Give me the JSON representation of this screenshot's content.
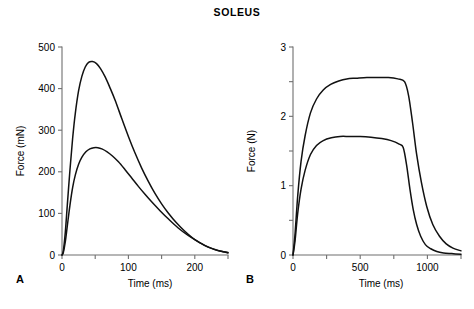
{
  "figure": {
    "title": "SOLEUS",
    "background": "#ffffff",
    "curve_color": "#111111",
    "axis_color": "#6f6f6f"
  },
  "panels": [
    {
      "label": "A",
      "xlabel": "Time (ms)",
      "ylabel": "Force (mN)"
    },
    {
      "label": "B",
      "xlabel": "Time (ms)",
      "ylabel": "Force (N)"
    }
  ],
  "chart_data": [
    {
      "type": "line",
      "panel": "A",
      "title": "SOLEUS",
      "xlabel": "Time (ms)",
      "ylabel": "Force (mN)",
      "xlim": [
        0,
        250
      ],
      "ylim": [
        0,
        500
      ],
      "xticks": [
        0,
        50,
        100,
        150,
        200,
        250
      ],
      "xticklabels": [
        "0",
        "",
        "100",
        "",
        "200",
        ""
      ],
      "yticks": [
        0,
        100,
        200,
        300,
        400,
        500
      ],
      "yticklabels": [
        "0",
        "100",
        "200",
        "300",
        "400",
        "500"
      ],
      "grid": false,
      "legend": "none",
      "annotation": "Isometric twitch responses; two superimposed traces",
      "series": [
        {
          "name": "upper-twitch",
          "peak_value": 465,
          "peak_time": 46,
          "x": [
            0,
            2,
            5,
            8,
            12,
            16,
            20,
            25,
            30,
            35,
            40,
            46,
            52,
            58,
            65,
            72,
            80,
            90,
            100,
            110,
            120,
            130,
            140,
            150,
            160,
            172,
            185,
            200,
            215,
            230,
            240,
            250
          ],
          "y": [
            0,
            10,
            55,
            120,
            205,
            280,
            340,
            395,
            430,
            452,
            463,
            465,
            460,
            448,
            428,
            403,
            372,
            328,
            285,
            245,
            209,
            177,
            148,
            123,
            101,
            78,
            57,
            37,
            23,
            13,
            9,
            6
          ]
        },
        {
          "name": "lower-twitch",
          "peak_value": 258,
          "peak_time": 54,
          "x": [
            0,
            2,
            5,
            8,
            12,
            16,
            20,
            25,
            30,
            36,
            42,
            48,
            54,
            60,
            68,
            76,
            85,
            95,
            105,
            115,
            125,
            135,
            148,
            160,
            175,
            190,
            205,
            220,
            235,
            245,
            250
          ],
          "y": [
            0,
            6,
            32,
            70,
            120,
            162,
            192,
            218,
            235,
            248,
            255,
            258,
            258,
            255,
            248,
            238,
            224,
            205,
            185,
            165,
            146,
            128,
            106,
            87,
            65,
            47,
            32,
            19,
            11,
            7,
            5
          ]
        }
      ]
    },
    {
      "type": "line",
      "panel": "B",
      "title": "SOLEUS",
      "xlabel": "Time (ms)",
      "ylabel": "Force (N)",
      "xlim": [
        0,
        1250
      ],
      "ylim": [
        0,
        3
      ],
      "xticks": [
        0,
        250,
        500,
        750,
        1000,
        1250
      ],
      "xticklabels": [
        "0",
        "",
        "500",
        "",
        "1000",
        ""
      ],
      "yticks": [
        0,
        0.5,
        1,
        1.5,
        2,
        2.5,
        3
      ],
      "yticklabels": [
        "0",
        "",
        "1",
        "",
        "2",
        "",
        "3"
      ],
      "grid": false,
      "legend": "none",
      "annotation": "Isometric tetanic contractions; two superimposed traces",
      "series": [
        {
          "name": "upper-tetanus",
          "plateau_value": 2.55,
          "plateau_start": 390,
          "relaxation_start": 830,
          "x": [
            0,
            15,
            35,
            60,
            90,
            130,
            175,
            225,
            280,
            340,
            400,
            470,
            550,
            630,
            710,
            780,
            830,
            860,
            890,
            920,
            955,
            995,
            1040,
            1090,
            1140,
            1190,
            1250
          ],
          "y": [
            0,
            0.3,
            0.85,
            1.35,
            1.72,
            2.05,
            2.25,
            2.38,
            2.46,
            2.51,
            2.54,
            2.55,
            2.56,
            2.56,
            2.56,
            2.54,
            2.5,
            2.3,
            1.9,
            1.45,
            1.05,
            0.7,
            0.44,
            0.27,
            0.16,
            0.1,
            0.06
          ]
        },
        {
          "name": "lower-tetanus",
          "plateau_value": 1.7,
          "plateau_start": 330,
          "relaxation_start": 820,
          "x": [
            0,
            15,
            35,
            60,
            90,
            130,
            175,
            225,
            285,
            350,
            420,
            500,
            580,
            660,
            730,
            790,
            820,
            845,
            870,
            895,
            920,
            950,
            985,
            1025,
            1070,
            1120,
            1180,
            1250
          ],
          "y": [
            0,
            0.2,
            0.6,
            0.95,
            1.22,
            1.45,
            1.58,
            1.65,
            1.69,
            1.71,
            1.71,
            1.71,
            1.7,
            1.68,
            1.65,
            1.6,
            1.55,
            1.3,
            0.95,
            0.65,
            0.44,
            0.27,
            0.15,
            0.09,
            0.05,
            0.03,
            0.02,
            0.01
          ]
        }
      ]
    }
  ]
}
